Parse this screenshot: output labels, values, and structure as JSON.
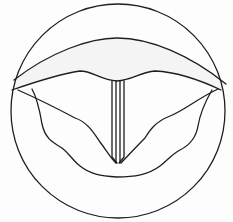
{
  "diagram": {
    "subject": "larynx-vocal-folds-view",
    "parts": [
      {
        "id": "outer-ring",
        "label": ""
      },
      {
        "id": "epiglottis-arch",
        "label": ""
      },
      {
        "id": "vocal-fold-upper-edge",
        "label": ""
      },
      {
        "id": "glottis-slit",
        "label": ""
      },
      {
        "id": "true-vocal-folds",
        "label": ""
      },
      {
        "id": "false-vocal-folds",
        "label": ""
      }
    ],
    "colors": {
      "stroke": "#1e1e1e",
      "background": "#fdfdfd",
      "shade": "#ececec"
    }
  }
}
